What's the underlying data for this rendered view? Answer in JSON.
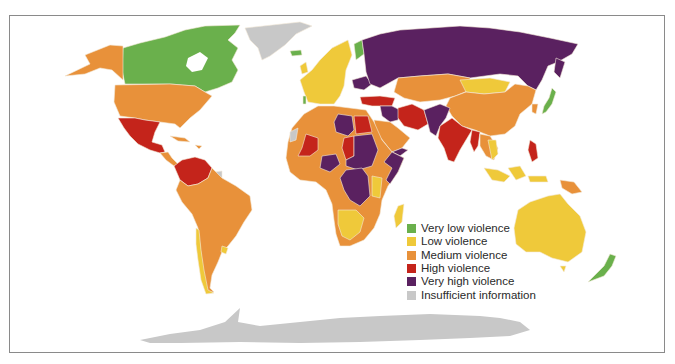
{
  "map": {
    "type": "choropleth world map",
    "categories": [
      {
        "key": "very_low",
        "label": "Very low violence",
        "color": "#6ab04c"
      },
      {
        "key": "low",
        "label": "Low violence",
        "color": "#efc93a"
      },
      {
        "key": "medium",
        "label": "Medium violence",
        "color": "#e8913a"
      },
      {
        "key": "high",
        "label": "High violence",
        "color": "#c4241b"
      },
      {
        "key": "very_high",
        "label": "Very high violence",
        "color": "#5a2160"
      },
      {
        "key": "insufficient",
        "label": "Insufficient information",
        "color": "#c8c8c8"
      }
    ],
    "regions": {
      "very_low": [
        "Canada",
        "Finland",
        "Japan",
        "New Zealand",
        "Iceland"
      ],
      "low": [
        "Western Europe",
        "Mongolia",
        "Chile",
        "Uruguay",
        "Australia",
        "Southern Africa",
        "Madagascar",
        "Vietnam",
        "Indonesia"
      ],
      "medium": [
        "United States",
        "Alaska",
        "China",
        "Brazil",
        "Argentina",
        "North Africa",
        "West Africa",
        "Saudi Arabia",
        "Central Asia",
        "Papua New Guinea",
        "Central America"
      ],
      "high": [
        "Mexico",
        "Venezuela",
        "Colombia",
        "Mali",
        "Egypt",
        "Turkey",
        "Iran",
        "India",
        "Myanmar",
        "Philippines",
        "Chad"
      ],
      "very_high": [
        "Russia",
        "Libya",
        "Sudan",
        "DR Congo",
        "Nigeria",
        "Somalia",
        "Afghanistan",
        "Pakistan",
        "Syria",
        "Iraq",
        "Ukraine"
      ],
      "insufficient": [
        "Greenland",
        "Antarctica",
        "Western Sahara",
        "French Guiana"
      ]
    }
  },
  "legend": {
    "items": [
      {
        "label": "Very low violence",
        "color": "#6ab04c"
      },
      {
        "label": "Low violence",
        "color": "#efc93a"
      },
      {
        "label": "Medium violence",
        "color": "#e8913a"
      },
      {
        "label": "High violence",
        "color": "#c4241b"
      },
      {
        "label": "Very high violence",
        "color": "#5a2160"
      },
      {
        "label": "Insufficient information",
        "color": "#c8c8c8"
      }
    ]
  }
}
